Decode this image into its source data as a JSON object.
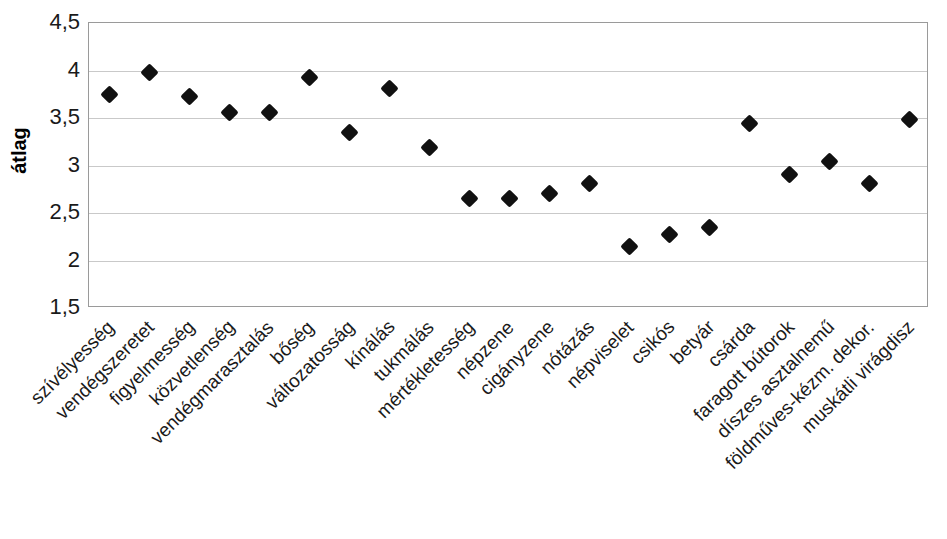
{
  "chart_data": {
    "type": "scatter",
    "title": "",
    "subtitle": "",
    "xlabel": "",
    "ylabel": "átlag",
    "ylim": [
      1.5,
      4.5
    ],
    "ytick_labels": [
      "4,5",
      "4",
      "3,5",
      "3",
      "2,5",
      "2",
      "1,5"
    ],
    "ytick_values": [
      4.5,
      4.0,
      3.5,
      3.0,
      2.5,
      2.0,
      1.5
    ],
    "grid": true,
    "legend": "none",
    "marker": "filled-diamond",
    "marker_color": "#111111",
    "categories": [
      "szívélyesség",
      "vendégszeretet",
      "figyelmesség",
      "közvetlenség",
      "vendégmarasztalás",
      "bőség",
      "változatosság",
      "kínálás",
      "tukmálás",
      "mértékletesség",
      "népzene",
      "cigányzene",
      "nótázás",
      "népviselet",
      "csikós",
      "betyár",
      "csárda",
      "faragott bútorok",
      "díszes asztalnemű",
      "földműves-kézm. dekor.",
      "muskátli virágdisz"
    ],
    "values": [
      3.75,
      3.98,
      3.73,
      3.56,
      3.56,
      3.93,
      3.35,
      3.81,
      3.19,
      2.65,
      2.65,
      2.71,
      2.81,
      2.15,
      2.27,
      2.35,
      3.44,
      2.91,
      3.04,
      2.81,
      3.48
    ]
  },
  "axis": {
    "border_color": "#9a9a9a",
    "grid_color": "#c9c9c9"
  }
}
